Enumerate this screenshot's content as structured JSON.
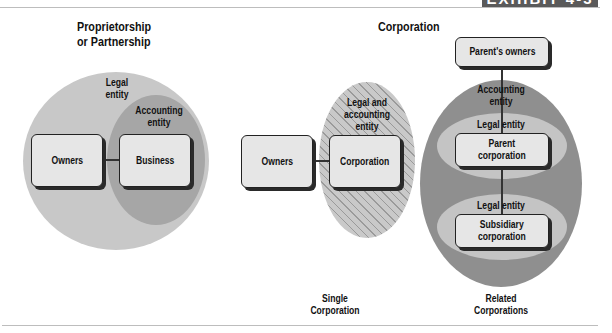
{
  "exhibit_badge": "EXHIBIT 4-3",
  "sections": {
    "proprietorship": {
      "title_line1": "Proprietorship",
      "title_line2": "or Partnership",
      "legal_entity_label_1": "Legal",
      "legal_entity_label_2": "entity",
      "accounting_entity_label_1": "Accounting",
      "accounting_entity_label_2": "entity",
      "boxes": {
        "owners": "Owners",
        "business": "Business"
      }
    },
    "corporation": {
      "title": "Corporation",
      "single": {
        "entity_label_1": "Legal and",
        "entity_label_2": "accounting",
        "entity_label_3": "entity",
        "boxes": {
          "owners": "Owners",
          "corporation": "Corporation"
        },
        "caption_line1": "Single",
        "caption_line2": "Corporation"
      },
      "related": {
        "boxes": {
          "parents_owners": "Parent's owners",
          "parent_line1": "Parent",
          "parent_line2": "corporation",
          "subsidiary_line1": "Subsidiary",
          "subsidiary_line2": "corporation"
        },
        "accounting_entity_label_1": "Accounting",
        "accounting_entity_label_2": "entity",
        "legal_entity_parent": "Legal entity",
        "legal_entity_subsidiary": "Legal entity",
        "caption_line1": "Related",
        "caption_line2": "Corporations"
      }
    }
  },
  "colors": {
    "light_gray": "#c8c8c8",
    "medium_gray": "#a8a8a8",
    "dark_gray": "#8f8f8f",
    "box_fill": "#e6e6e6",
    "badge_bg": "#5a5a5a"
  }
}
